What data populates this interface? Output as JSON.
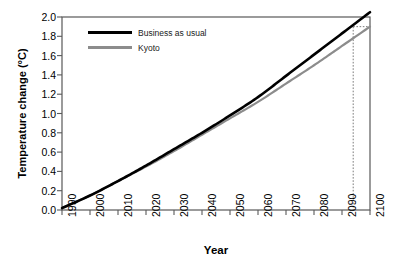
{
  "chart_data": {
    "type": "line",
    "title": "",
    "xlabel": "Year",
    "ylabel": "Temperature change (°C)",
    "xlim": [
      1990,
      2100
    ],
    "ylim": [
      0.0,
      2.0
    ],
    "xticks": [
      1990,
      2000,
      2010,
      2020,
      2030,
      2040,
      2050,
      2060,
      2070,
      2080,
      2090,
      2100
    ],
    "yticks": [
      "0.0",
      "0.2",
      "0.4",
      "0.6",
      "0.8",
      "1.0",
      "1.2",
      "1.4",
      "1.6",
      "1.8",
      "2.0"
    ],
    "grid": false,
    "legend_position": "top-left-inside",
    "x": [
      1990,
      2000,
      2010,
      2020,
      2030,
      2040,
      2050,
      2060,
      2070,
      2080,
      2090,
      2100
    ],
    "series": [
      {
        "name": "Business as usual",
        "color": "#000000",
        "line_width": 2.6,
        "values": [
          0.02,
          0.15,
          0.3,
          0.46,
          0.63,
          0.8,
          0.98,
          1.17,
          1.39,
          1.61,
          1.83,
          2.05
        ]
      },
      {
        "name": "Kyoto",
        "color": "#8c8c8c",
        "line_width": 2.2,
        "values": [
          0.02,
          0.15,
          0.3,
          0.45,
          0.61,
          0.78,
          0.95,
          1.12,
          1.31,
          1.5,
          1.7,
          1.9
        ]
      }
    ],
    "annotations": [
      {
        "kind": "reference-line",
        "orientation": "vertical",
        "x": 2094,
        "style": "dotted",
        "color": "#7a7a7a"
      },
      {
        "kind": "reference-line",
        "orientation": "horizontal",
        "y": 1.9,
        "x_from": 2094,
        "x_to": 2100,
        "style": "dotted",
        "color": "#7a7a7a"
      }
    ]
  },
  "legend": {
    "items": [
      {
        "label": "Business as usual"
      },
      {
        "label": "Kyoto"
      }
    ]
  },
  "axes": {
    "x_title": "Year",
    "y_title": "Temperature change (°C)",
    "x_tick_labels": [
      "1990",
      "2000",
      "2010",
      "2020",
      "2030",
      "2040",
      "2050",
      "2060",
      "2070",
      "2080",
      "2090",
      "2100"
    ],
    "y_tick_labels": [
      "2.0",
      "1.8",
      "1.6",
      "1.4",
      "1.2",
      "1.0",
      "0.8",
      "0.6",
      "0.4",
      "0.2",
      "0.0"
    ]
  },
  "colors": {
    "business_as_usual": "#000000",
    "kyoto": "#8c8c8c",
    "frame": "#595959",
    "reference_line": "#7a7a7a",
    "background": "#ffffff"
  }
}
